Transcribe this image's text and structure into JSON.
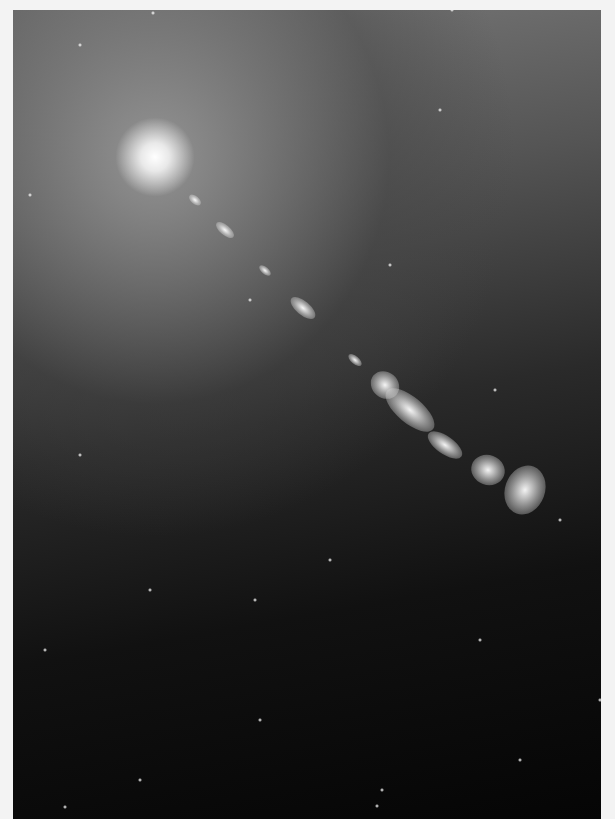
{
  "image": {
    "subject": "galaxy core with relativistic jet",
    "background_color": "#f3f3f3",
    "core_position": [
      142,
      147
    ],
    "jet_knots": [
      {
        "x": 195,
        "y": 200,
        "w": 14,
        "h": 8,
        "r": 40
      },
      {
        "x": 225,
        "y": 230,
        "w": 22,
        "h": 10,
        "r": 40
      },
      {
        "x": 265,
        "y": 270,
        "w": 14,
        "h": 7,
        "r": 40
      },
      {
        "x": 303,
        "y": 308,
        "w": 30,
        "h": 14,
        "r": 40
      },
      {
        "x": 355,
        "y": 360,
        "w": 16,
        "h": 8,
        "r": 40
      },
      {
        "x": 385,
        "y": 385,
        "w": 30,
        "h": 26,
        "r": 40
      },
      {
        "x": 410,
        "y": 410,
        "w": 60,
        "h": 26,
        "r": 40
      },
      {
        "x": 445,
        "y": 445,
        "w": 40,
        "h": 18,
        "r": 35
      },
      {
        "x": 488,
        "y": 470,
        "w": 34,
        "h": 30,
        "r": 20
      },
      {
        "x": 525,
        "y": 490,
        "w": 40,
        "h": 50,
        "r": 20
      }
    ],
    "stars": [
      [
        153,
        13
      ],
      [
        452,
        10
      ],
      [
        80,
        45
      ],
      [
        440,
        110
      ],
      [
        30,
        195
      ],
      [
        390,
        265
      ],
      [
        250,
        300
      ],
      [
        495,
        390
      ],
      [
        80,
        455
      ],
      [
        560,
        520
      ],
      [
        330,
        560
      ],
      [
        150,
        590
      ],
      [
        255,
        600
      ],
      [
        45,
        650
      ],
      [
        480,
        640
      ],
      [
        260,
        720
      ],
      [
        140,
        780
      ],
      [
        65,
        807
      ],
      [
        377,
        806
      ],
      [
        382,
        790
      ],
      [
        520,
        760
      ],
      [
        600,
        700
      ]
    ]
  }
}
